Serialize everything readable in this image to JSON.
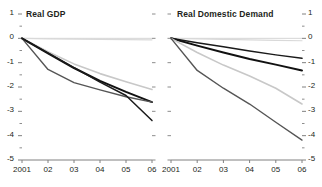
{
  "figure": {
    "background": "#ffffff",
    "axis_color": "#808080",
    "text_color": "#231f20"
  },
  "chart_data": [
    {
      "type": "line",
      "title": "Real GDP",
      "panel": "left",
      "xlabel": "",
      "ylabel": "",
      "x": [
        "2001",
        "02",
        "03",
        "04",
        "05",
        "06"
      ],
      "xticklabels": [
        "2001",
        "02",
        "03",
        "04",
        "05",
        "06"
      ],
      "yticklabels": [
        "1",
        "0",
        "-1",
        "-2",
        "-3",
        "-4",
        "-5"
      ],
      "ylim": [
        -5,
        1
      ],
      "yticks": [
        1,
        0,
        -1,
        -2,
        -3,
        -4,
        -5
      ],
      "minor_ticks": true,
      "grid": false,
      "legend": "none",
      "axis_side": "left",
      "series": [
        {
          "name": "series-1",
          "color": "#d9d9d9",
          "width": 1.2,
          "values": [
            0,
            -0.02,
            -0.03,
            -0.04,
            -0.05,
            -0.06
          ]
        },
        {
          "name": "series-2",
          "color": "#c8c8c8",
          "width": 1.6,
          "values": [
            0,
            -0.55,
            -1.05,
            -1.45,
            -1.78,
            -2.1
          ]
        },
        {
          "name": "series-3",
          "color": "#111111",
          "width": 2.0,
          "values": [
            0,
            -0.62,
            -1.22,
            -1.75,
            -2.2,
            -2.62
          ]
        },
        {
          "name": "series-4",
          "color": "#555555",
          "width": 1.4,
          "values": [
            0,
            -1.28,
            -1.82,
            -2.12,
            -2.4,
            -2.62
          ]
        },
        {
          "name": "series-5",
          "color": "#1a1a1a",
          "width": 1.5,
          "values": [
            0,
            -0.6,
            -1.2,
            -1.8,
            -2.35,
            -3.38
          ]
        }
      ]
    },
    {
      "type": "line",
      "title": "Real Domestic Demand",
      "panel": "right",
      "xlabel": "",
      "ylabel": "",
      "x": [
        "2001",
        "02",
        "03",
        "04",
        "05",
        "06"
      ],
      "xticklabels": [
        "2001",
        "02",
        "03",
        "04",
        "05",
        "06"
      ],
      "yticklabels": [
        "1",
        "0",
        "-1",
        "-2",
        "-3",
        "-4",
        "-5"
      ],
      "ylim": [
        -5,
        1
      ],
      "yticks": [
        1,
        0,
        -1,
        -2,
        -3,
        -4,
        -5
      ],
      "minor_ticks": true,
      "grid": false,
      "legend": "none",
      "axis_side": "right",
      "series": [
        {
          "name": "series-1",
          "color": "#d9d9d9",
          "width": 1.2,
          "values": [
            0,
            -0.02,
            -0.04,
            -0.06,
            -0.08,
            -0.1
          ]
        },
        {
          "name": "series-2",
          "color": "#1a1a1a",
          "width": 1.5,
          "values": [
            0,
            -0.18,
            -0.35,
            -0.52,
            -0.68,
            -0.82
          ]
        },
        {
          "name": "series-3",
          "color": "#111111",
          "width": 2.0,
          "values": [
            0,
            -0.3,
            -0.58,
            -0.85,
            -1.08,
            -1.32
          ]
        },
        {
          "name": "series-4",
          "color": "#c8c8c8",
          "width": 1.6,
          "values": [
            0,
            -0.58,
            -1.1,
            -1.55,
            -2.05,
            -2.7
          ]
        },
        {
          "name": "series-5",
          "color": "#555555",
          "width": 1.4,
          "values": [
            0,
            -1.32,
            -2.05,
            -2.7,
            -3.45,
            -4.18
          ]
        }
      ]
    }
  ]
}
